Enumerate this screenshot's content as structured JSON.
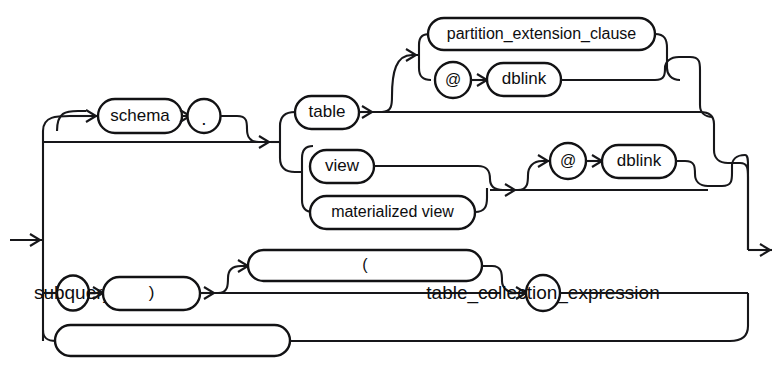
{
  "diagram": {
    "kind": "railroad-syntax-diagram",
    "title": "",
    "background_color": "#ffffff",
    "line_color": "#17171a",
    "text_color": "#0d0d0f",
    "entry_label": "entry-arrow",
    "exit_label": "exit-arrow",
    "nodes": [
      {
        "id": "schema",
        "label": "schema",
        "shape": "rounded-box",
        "x": 98,
        "y": 99,
        "w": 84,
        "h": 34
      },
      {
        "id": "dot",
        "label": ".",
        "shape": "circle",
        "x": 189,
        "y": 99,
        "w": 31,
        "h": 34
      },
      {
        "id": "table",
        "label": "table",
        "shape": "rounded-box",
        "x": 295,
        "y": 96,
        "w": 64,
        "h": 33
      },
      {
        "id": "partition_extension_clause",
        "label": "partition_extension_clause",
        "shape": "rounded-box",
        "x": 428,
        "y": 18,
        "w": 227,
        "h": 32
      },
      {
        "id": "at_top",
        "label": "@",
        "shape": "circle",
        "x": 436,
        "y": 62,
        "w": 35,
        "h": 35
      },
      {
        "id": "dblink_top",
        "label": "dblink",
        "shape": "rounded-box",
        "x": 487,
        "y": 63,
        "w": 74,
        "h": 33
      },
      {
        "id": "view",
        "label": "view",
        "shape": "rounded-box",
        "x": 310,
        "y": 150,
        "w": 64,
        "h": 33
      },
      {
        "id": "materialized_view",
        "label": "materialized view",
        "shape": "rounded-box",
        "x": 310,
        "y": 196,
        "w": 165,
        "h": 33
      },
      {
        "id": "at_mid",
        "label": "@",
        "shape": "circle",
        "x": 551,
        "y": 152,
        "w": 35,
        "h": 35
      },
      {
        "id": "dblink_mid",
        "label": "dblink",
        "shape": "rounded-box",
        "x": 602,
        "y": 153,
        "w": 74,
        "h": 33
      },
      {
        "id": "subquery_restriction_clause",
        "label": "subquery_restriction_clause",
        "shape": "rounded-box",
        "x": 248,
        "y": 250,
        "w": 234,
        "h": 31
      },
      {
        "id": "paren_open",
        "label": "(",
        "shape": "circle",
        "x": 57,
        "y": 277,
        "w": 32,
        "h": 35
      },
      {
        "id": "subquery",
        "label": "subquery",
        "shape": "rounded-box",
        "x": 103,
        "y": 278,
        "w": 97,
        "h": 33
      },
      {
        "id": "paren_close",
        "label": ")",
        "shape": "circle",
        "x": 526,
        "y": 280,
        "w": 34,
        "h": 35
      },
      {
        "id": "table_collection_expression",
        "label": "table_collection_expression",
        "shape": "rounded-box",
        "x": 55,
        "y": 325,
        "w": 235,
        "h": 31
      }
    ],
    "rails": {
      "entry_arrow_y": 240,
      "exit_arrow_y": 250,
      "left_bus_x": 43,
      "right_bus_x": 748,
      "main_line_y": 142
    }
  }
}
